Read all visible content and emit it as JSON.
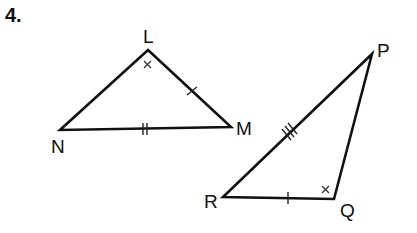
{
  "problem": {
    "number": "4."
  },
  "colors": {
    "line": "#111111",
    "background": "#ffffff",
    "mark": "#333333"
  },
  "triangles": [
    {
      "name": "LMN",
      "vertices": [
        {
          "label": "L",
          "x": 148,
          "y": 50
        },
        {
          "label": "M",
          "x": 231,
          "y": 127
        },
        {
          "label": "N",
          "x": 60,
          "y": 130
        }
      ],
      "side_marks": [
        {
          "side": "LM",
          "ticks": 1
        },
        {
          "side": "NM",
          "ticks": 2
        }
      ],
      "angle_marks": [
        {
          "vertex": "L",
          "symbol": "×"
        }
      ]
    },
    {
      "name": "PQR",
      "vertices": [
        {
          "label": "P",
          "x": 372,
          "y": 54
        },
        {
          "label": "Q",
          "x": 334,
          "y": 199
        },
        {
          "label": "R",
          "x": 223,
          "y": 197
        }
      ],
      "side_marks": [
        {
          "side": "RP",
          "ticks": 3
        },
        {
          "side": "RQ",
          "ticks": 1
        }
      ],
      "angle_marks": [
        {
          "vertex": "Q",
          "symbol": "×"
        }
      ]
    }
  ],
  "labels": {
    "L": "L",
    "M": "M",
    "N": "N",
    "P": "P",
    "Q": "Q",
    "R": "R"
  }
}
